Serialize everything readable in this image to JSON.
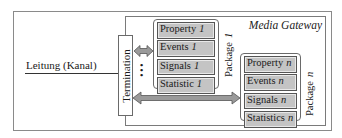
{
  "diagram": {
    "container_title": "Media Gateway",
    "line_label": "Leitung (Kanal)",
    "termination_label": "Termination",
    "ellipsis": "⋮",
    "packages": [
      {
        "label": "Package",
        "number": "1",
        "items": [
          {
            "label": "Property",
            "number": "1"
          },
          {
            "label": "Events",
            "number": "1"
          },
          {
            "label": "Signals",
            "number": "1"
          },
          {
            "label": "Statistic",
            "number": "1"
          }
        ]
      },
      {
        "label": "Package",
        "number": "n",
        "items": [
          {
            "label": "Property",
            "number": "n"
          },
          {
            "label": "Events",
            "number": "n"
          },
          {
            "label": "Signals",
            "number": "n"
          },
          {
            "label": "Statistics",
            "number": "n"
          }
        ]
      }
    ],
    "colors": {
      "item_fill": "#c4c4c4",
      "arrow_fill": "#9a9a9a",
      "border": "#6a6a6a"
    }
  }
}
